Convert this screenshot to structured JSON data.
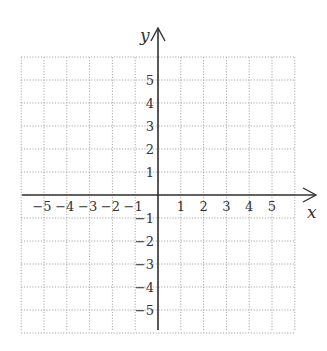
{
  "diagram": {
    "type": "coordinate-plane",
    "x_axis_label": "x",
    "y_axis_label": "y",
    "x_ticks": [
      "−5",
      "−4",
      "−3",
      "−2",
      "−1",
      "1",
      "2",
      "3",
      "4",
      "5"
    ],
    "y_ticks_positive": [
      "1",
      "2",
      "3",
      "4",
      "5"
    ],
    "y_ticks_negative": [
      "−1",
      "−2",
      "−3",
      "−4",
      "−5"
    ],
    "grid": {
      "x_range": [
        -6,
        6
      ],
      "y_range": [
        -6,
        6
      ],
      "style": "dotted"
    },
    "colors": {
      "axis": "#333333",
      "grid": "#aaaaaa",
      "text": "#333333"
    }
  }
}
